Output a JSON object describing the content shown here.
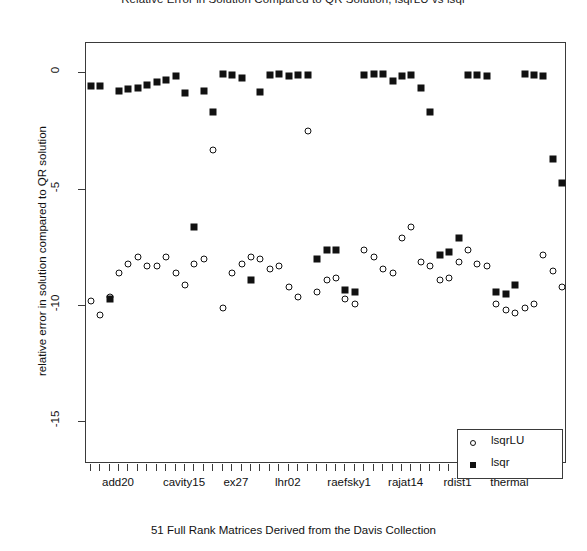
{
  "chart_data": {
    "type": "scatter",
    "title": "Relative Error in Solution Compared to QR Solution, lsqrLU vs lsqr",
    "xlabel": "51 Full Rank Matrices Derived from the Davis Collection",
    "ylabel": "relative error in solution compared to QR solution",
    "ylim": [
      -16.8,
      1.3
    ],
    "yticks": [
      0,
      -5,
      -10,
      -15
    ],
    "ytick_labels": [
      "0",
      "-5",
      "-10",
      "-15"
    ],
    "xlim": [
      0.5,
      51.5
    ],
    "n_points": 51,
    "grid": false,
    "legend_position": "bottom-right",
    "xtick_group_labels": [
      "add20",
      "cavity15",
      "ex27",
      "lhr02",
      "raefsky1",
      "rajat14",
      "rdist1",
      "thermal"
    ],
    "xtick_group_positions": [
      4,
      11,
      16.5,
      22,
      28.5,
      34.5,
      40,
      45.5
    ],
    "series": [
      {
        "name": "lsqrLU",
        "marker": "open-circle",
        "color": "#111111",
        "x": [
          1,
          2,
          3,
          4,
          5,
          6,
          7,
          8,
          9,
          10,
          11,
          12,
          13,
          14,
          15,
          16,
          17,
          18,
          19,
          20,
          21,
          22,
          23,
          24,
          25,
          26,
          27,
          28,
          29,
          30,
          31,
          32,
          33,
          34,
          35,
          36,
          37,
          38,
          39,
          40,
          41,
          42,
          43,
          44,
          45,
          46,
          47,
          48,
          49,
          50,
          51
        ],
        "values": [
          -9.8,
          -10.4,
          -9.6,
          -8.6,
          -8.2,
          -7.9,
          -8.3,
          -8.3,
          -7.9,
          -8.6,
          -9.1,
          -8.2,
          -8.0,
          -3.3,
          -10.1,
          -8.6,
          -8.2,
          -7.9,
          -8.0,
          -8.4,
          -8.3,
          -9.2,
          -9.6,
          -2.5,
          -9.4,
          -8.9,
          -8.8,
          -9.7,
          -9.9,
          -7.6,
          -7.9,
          -8.4,
          -8.6,
          -7.1,
          -6.6,
          -8.1,
          -8.3,
          -8.9,
          -8.8,
          -8.1,
          -7.6,
          -8.2,
          -8.3,
          -9.9,
          -10.2,
          -10.3,
          -10.1,
          -9.9,
          -7.8,
          -8.5,
          -9.2
        ]
      },
      {
        "name": "lsqr",
        "marker": "filled-square",
        "color": "#111111",
        "x": [
          1,
          2,
          3,
          4,
          5,
          6,
          7,
          8,
          9,
          10,
          11,
          12,
          13,
          14,
          15,
          16,
          17,
          18,
          19,
          20,
          21,
          22,
          23,
          24,
          25,
          26,
          27,
          28,
          29,
          30,
          31,
          32,
          33,
          34,
          35,
          36,
          37,
          38,
          39,
          40,
          41,
          42,
          43,
          44,
          45,
          46,
          47,
          48,
          49,
          50,
          51
        ],
        "values": [
          -0.55,
          -0.55,
          -9.7,
          -0.75,
          -0.68,
          -0.62,
          -0.5,
          -0.38,
          -0.28,
          -0.1,
          -0.85,
          -6.6,
          -0.75,
          -1.65,
          -0.05,
          -0.07,
          -0.22,
          -8.9,
          -0.8,
          -0.08,
          -0.05,
          -0.1,
          -0.08,
          -0.08,
          -8.0,
          -7.6,
          -7.6,
          -9.3,
          -9.4,
          -0.07,
          -0.05,
          -0.05,
          -0.35,
          -0.1,
          -0.07,
          -0.62,
          -1.65,
          -7.8,
          -7.7,
          -7.1,
          -0.08,
          -0.08,
          -0.1,
          -9.4,
          -9.5,
          -9.1,
          -0.05,
          -0.08,
          -0.1,
          -3.7,
          -4.7
        ]
      }
    ]
  },
  "legend": {
    "entries": [
      {
        "label": "lsqrLU",
        "marker": "open-circle"
      },
      {
        "label": "lsqr",
        "marker": "filled-square"
      }
    ]
  }
}
